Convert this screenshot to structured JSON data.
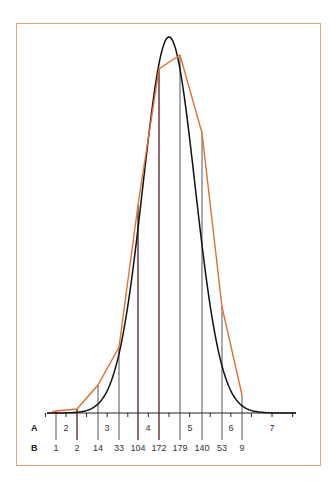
{
  "chart_data": {
    "type": "bar",
    "title": "",
    "xlabel": "",
    "ylabel": "",
    "row_labels": {
      "a": "A",
      "b": "B"
    },
    "a_axis_ticks": [
      "2",
      "3",
      "4",
      "5",
      "6",
      "7"
    ],
    "categories": [
      "1",
      "2",
      "14",
      "33",
      "104",
      "172",
      "179",
      "140",
      "53",
      "9"
    ],
    "values": [
      1,
      2,
      14,
      33,
      104,
      172,
      179,
      140,
      53,
      9
    ],
    "series": [
      {
        "name": "observed frequencies (vertical lines)",
        "values": [
          1,
          2,
          14,
          33,
          104,
          172,
          179,
          140,
          53,
          9
        ],
        "color": "#555555"
      },
      {
        "name": "frequency polygon",
        "values": [
          1,
          2,
          14,
          33,
          104,
          172,
          179,
          140,
          53,
          9
        ],
        "color": "#e07030"
      },
      {
        "name": "normal curve",
        "color": "#111111"
      }
    ],
    "grid": false,
    "legend": "none",
    "ylim": [
      0,
      190
    ]
  },
  "colors": {
    "frame": "#e8a07a",
    "polygon": "#e07030",
    "curve": "#111111",
    "bars": "#555555",
    "bars_dark": "#6a2a2a",
    "axis": "#222222"
  }
}
